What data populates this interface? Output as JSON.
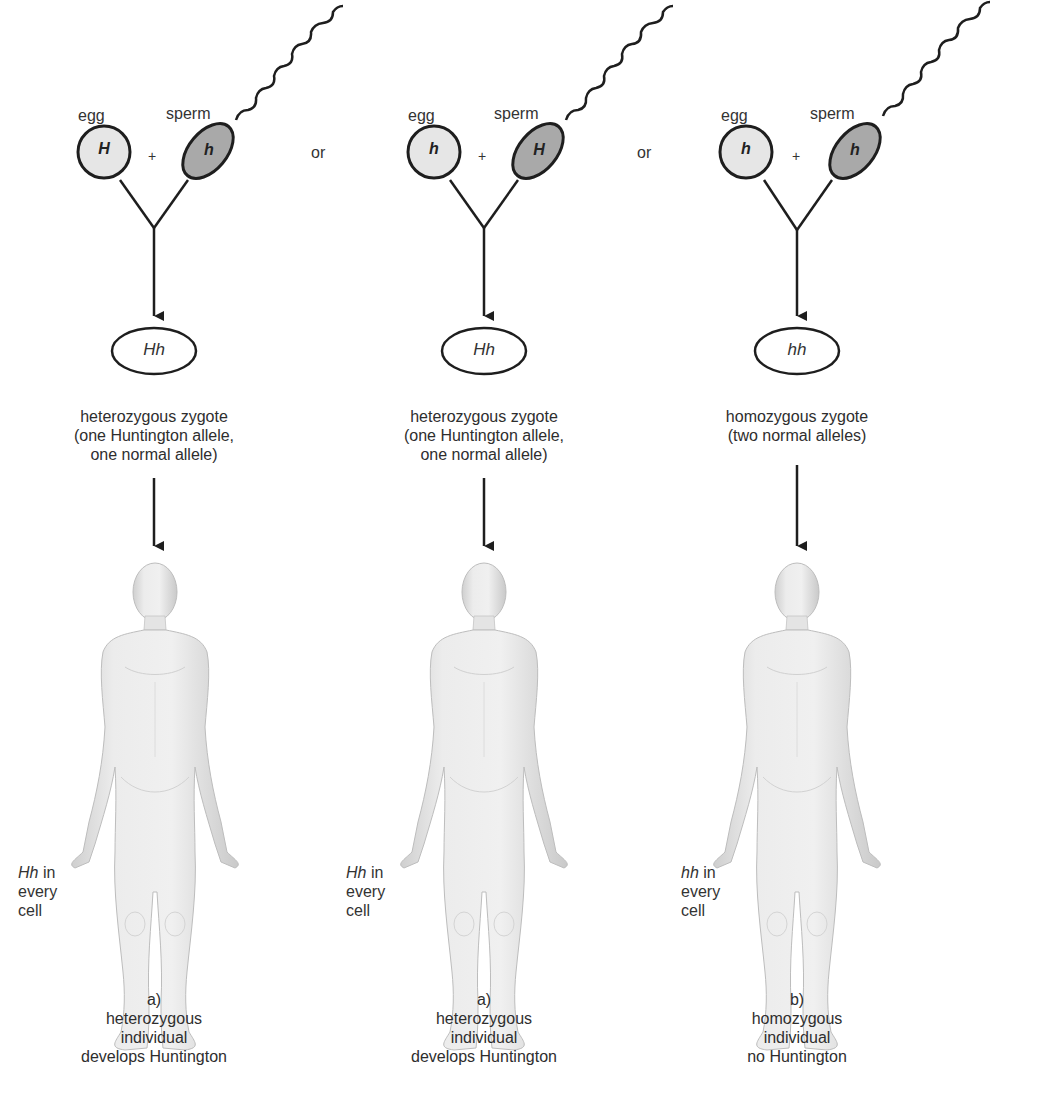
{
  "diagram": {
    "type": "inheritance",
    "columns": [
      {
        "egg_label": "egg",
        "sperm_label": "sperm",
        "egg_allele": "H",
        "sperm_allele": "h",
        "plus": "+",
        "separator": "or",
        "zygote_genotype": "Hh",
        "zygote_description": [
          "heterozygous zygote",
          "(one Huntington allele,",
          "one normal allele)"
        ],
        "cell_note": {
          "genotype": "Hh",
          "line1_suffix": " in",
          "line2": "every",
          "line3": "cell"
        },
        "outcome": [
          "a)",
          "heterozygous",
          "individual",
          "develops Huntington"
        ]
      },
      {
        "egg_label": "egg",
        "sperm_label": "sperm",
        "egg_allele": "h",
        "sperm_allele": "H",
        "plus": "+",
        "separator": "or",
        "zygote_genotype": "Hh",
        "zygote_description": [
          "heterozygous zygote",
          "(one Huntington allele,",
          "one normal allele)"
        ],
        "cell_note": {
          "genotype": "Hh",
          "line1_suffix": " in",
          "line2": "every",
          "line3": "cell"
        },
        "outcome": [
          "a)",
          "heterozygous",
          "individual",
          "develops Huntington"
        ]
      },
      {
        "egg_label": "egg",
        "sperm_label": "sperm",
        "egg_allele": "h",
        "sperm_allele": "h",
        "plus": "+",
        "zygote_genotype": "hh",
        "zygote_description": [
          "homozygous zygote",
          "(two normal alleles)"
        ],
        "cell_note": {
          "genotype": "hh",
          "line1_suffix": " in",
          "line2": "every",
          "line3": "cell"
        },
        "outcome": [
          "b)",
          "homozygous",
          "individual",
          "no Huntington"
        ]
      }
    ],
    "colors": {
      "egg_fill": "#e6e6e6",
      "sperm_fill": "#a9a9a9",
      "stroke": "#1e1e1e",
      "body_fill": "#e9e9e9",
      "body_shade": "#d2d2d2"
    }
  }
}
